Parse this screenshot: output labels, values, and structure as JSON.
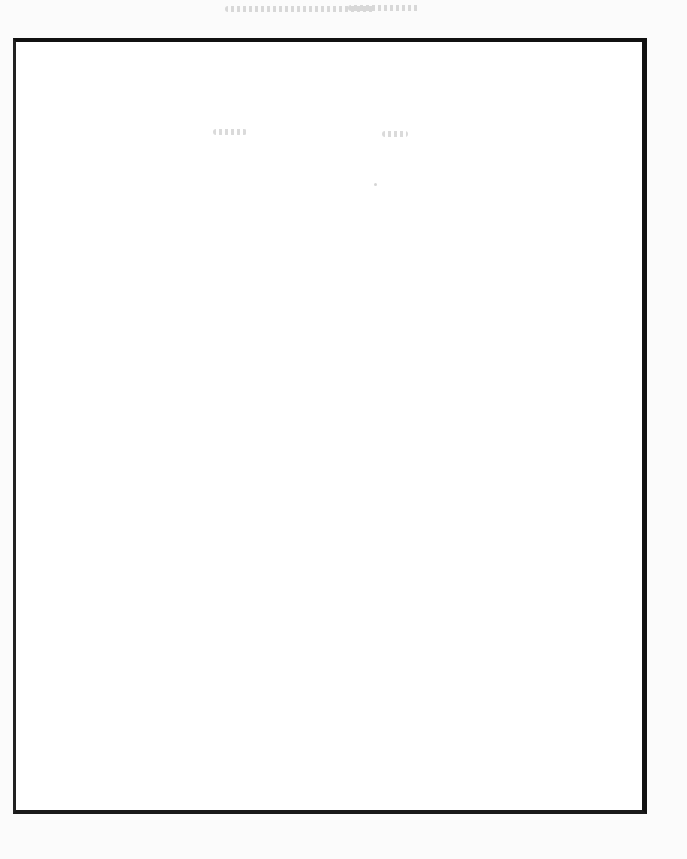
{
  "page": {
    "type": "scanned-blank-page",
    "background": "#fbfbfb",
    "frame_color": "#111111",
    "bleed_through_color": "#969696",
    "legible_text": []
  }
}
